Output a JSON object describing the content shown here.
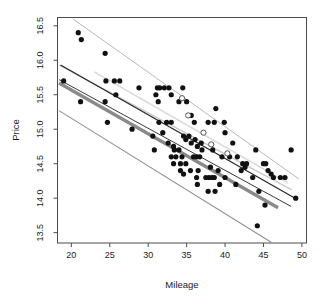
{
  "chart_data": {
    "type": "scatter",
    "title": "",
    "xlabel": "Mileage",
    "ylabel": "Price",
    "xlim": [
      18.2,
      50.6
    ],
    "ylim": [
      13.35,
      16.62
    ],
    "xticks": [
      20,
      25,
      30,
      35,
      40,
      45,
      50
    ],
    "yticks": [
      13.5,
      14.0,
      14.5,
      15.0,
      15.5,
      16.0,
      16.5
    ],
    "xtick_labels": [
      "20",
      "25",
      "30",
      "35",
      "40",
      "45",
      "50"
    ],
    "ytick_labels": [
      "13.5",
      "14.0",
      "14.5",
      "15.0",
      "15.5",
      "16.0",
      "16.5"
    ],
    "grid": false,
    "legend": "none",
    "point_color": "#111111",
    "point_radius": 2.6,
    "points": [
      [
        20.9,
        16.4
      ],
      [
        21.3,
        16.3
      ],
      [
        24.4,
        16.1
      ],
      [
        19.0,
        15.7
      ],
      [
        24.5,
        15.7
      ],
      [
        25.6,
        15.7
      ],
      [
        26.3,
        15.7
      ],
      [
        21.2,
        15.4
      ],
      [
        24.4,
        15.4
      ],
      [
        25.8,
        15.5
      ],
      [
        28.8,
        15.6
      ],
      [
        31.2,
        15.6
      ],
      [
        31.5,
        15.6
      ],
      [
        32.1,
        15.6
      ],
      [
        32.7,
        15.6
      ],
      [
        34.5,
        15.6
      ],
      [
        31.0,
        15.5
      ],
      [
        33.0,
        15.5
      ],
      [
        31.3,
        15.4
      ],
      [
        34.0,
        15.4
      ],
      [
        35.0,
        15.4
      ],
      [
        24.7,
        15.1
      ],
      [
        27.9,
        15.0
      ],
      [
        30.6,
        14.9
      ],
      [
        31.4,
        15.1
      ],
      [
        32.4,
        15.1
      ],
      [
        33.0,
        15.1
      ],
      [
        35.6,
        15.2
      ],
      [
        36.0,
        15.1
      ],
      [
        37.8,
        15.1
      ],
      [
        38.6,
        15.1
      ],
      [
        39.9,
        15.1
      ],
      [
        40.0,
        14.95
      ],
      [
        38.8,
        15.3
      ],
      [
        41.0,
        14.8
      ],
      [
        30.8,
        14.7
      ],
      [
        32.6,
        14.8
      ],
      [
        33.3,
        14.75
      ],
      [
        33.4,
        14.7
      ],
      [
        34.0,
        14.7
      ],
      [
        34.9,
        14.85
      ],
      [
        35.6,
        14.8
      ],
      [
        36.1,
        14.85
      ],
      [
        36.4,
        14.75
      ],
      [
        36.9,
        14.8
      ],
      [
        37.0,
        14.7
      ],
      [
        38.4,
        14.7
      ],
      [
        33.0,
        14.6
      ],
      [
        33.6,
        14.6
      ],
      [
        34.4,
        14.6
      ],
      [
        33.3,
        14.5
      ],
      [
        34.2,
        14.5
      ],
      [
        34.9,
        14.5
      ],
      [
        35.9,
        14.6
      ],
      [
        36.3,
        14.6
      ],
      [
        36.7,
        14.6
      ],
      [
        39.6,
        14.6
      ],
      [
        40.6,
        14.6
      ],
      [
        41.6,
        14.6
      ],
      [
        42.3,
        14.5
      ],
      [
        42.6,
        14.45
      ],
      [
        42.8,
        14.5
      ],
      [
        44.0,
        14.7
      ],
      [
        45.0,
        14.5
      ],
      [
        45.3,
        14.5
      ],
      [
        45.6,
        14.4
      ],
      [
        46.0,
        14.35
      ],
      [
        46.3,
        14.3
      ],
      [
        47.2,
        14.3
      ],
      [
        47.8,
        14.3
      ],
      [
        48.6,
        14.7
      ],
      [
        49.2,
        14.0
      ],
      [
        45.2,
        13.9
      ],
      [
        44.2,
        13.6
      ],
      [
        36.3,
        14.3
      ],
      [
        36.4,
        14.2
      ],
      [
        37.5,
        14.3
      ],
      [
        37.9,
        14.3
      ],
      [
        38.3,
        14.3
      ],
      [
        38.6,
        14.3
      ],
      [
        37.8,
        14.1
      ],
      [
        38.7,
        14.1
      ],
      [
        39.3,
        14.2
      ],
      [
        41.4,
        14.2
      ],
      [
        40.0,
        14.3
      ],
      [
        34.6,
        14.35
      ],
      [
        43.6,
        14.3
      ],
      [
        44.4,
        14.1
      ],
      [
        34.2,
        14.4
      ],
      [
        35.5,
        14.4
      ],
      [
        39.1,
        14.4
      ],
      [
        42.1,
        14.4
      ],
      [
        31.9,
        14.95
      ],
      [
        34.6,
        14.9
      ],
      [
        35.3,
        14.9
      ],
      [
        36.5,
        14.4
      ],
      [
        38.1,
        14.45
      ]
    ],
    "lines": [
      {
        "name": "upper-outer-gray",
        "x1": 20.2,
        "y1": 16.6,
        "x2": 49.6,
        "y2": 14.28,
        "color": "#b8b8b8",
        "width": 1.0
      },
      {
        "name": "upper-inner-gray",
        "x1": 18.4,
        "y1": 15.93,
        "x2": 48.7,
        "y2": 14.12,
        "color": "#c9c9c9",
        "width": 1.3
      },
      {
        "name": "regression-black-upper",
        "x1": 18.6,
        "y1": 15.93,
        "x2": 49.4,
        "y2": 13.98,
        "color": "#222222",
        "width": 1.1
      },
      {
        "name": "regression-dark-thin",
        "x1": 18.4,
        "y1": 15.72,
        "x2": 48.6,
        "y2": 13.88,
        "color": "#3a3a3a",
        "width": 1.0
      },
      {
        "name": "robust-thick-gray",
        "x1": 18.4,
        "y1": 15.67,
        "x2": 46.9,
        "y2": 13.86,
        "color": "#8a8a8a",
        "width": 3.4
      },
      {
        "name": "lower-outer-gray",
        "x1": 18.4,
        "y1": 15.27,
        "x2": 46.0,
        "y2": 13.36,
        "color": "#909090",
        "width": 1.1
      },
      {
        "name": "mid-pale-band",
        "x1": 23.0,
        "y1": 15.83,
        "x2": 48.2,
        "y2": 14.22,
        "color": "#dcdcdc",
        "width": 1.6
      }
    ],
    "open_points": [
      [
        34.4,
        15.45
      ],
      [
        37.2,
        14.95
      ],
      [
        40.3,
        14.65
      ],
      [
        35.2,
        15.2
      ],
      [
        38.2,
        14.78
      ]
    ]
  },
  "chart_meta": {
    "axis_color": "#4d4d4d",
    "text_color": "#1a1a1a",
    "background": "#ffffff"
  }
}
